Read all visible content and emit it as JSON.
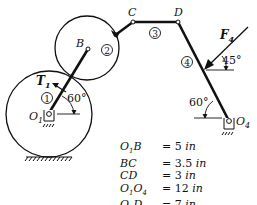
{
  "diagram": {
    "type": "mechanism-linkage",
    "points": {
      "O1": "O1",
      "B": "B",
      "C": "C",
      "D": "D",
      "O4": "O4"
    },
    "link_numbers": [
      "1",
      "2",
      "3",
      "4"
    ],
    "torque_label": "T1",
    "force_label": "F4",
    "angles": {
      "link1_angle": "60°",
      "link4_angle": "60°",
      "force_angle": "45°"
    }
  },
  "dimensions": [
    {
      "name": "O1B",
      "eq": "=",
      "value": "5",
      "unit": "in"
    },
    {
      "name": "BC",
      "eq": "=",
      "value": "3.5",
      "unit": "in"
    },
    {
      "name": "CD",
      "eq": "=",
      "value": "3",
      "unit": "in"
    },
    {
      "name": "O1O4",
      "eq": "=",
      "value": "12",
      "unit": "in"
    },
    {
      "name": "O4D",
      "eq": "=",
      "value": "7",
      "unit": "in"
    }
  ]
}
